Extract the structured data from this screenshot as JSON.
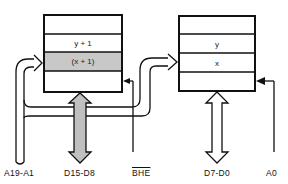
{
  "diagram": {
    "type": "memory-bank-organization",
    "colors": {
      "line": "#111111",
      "highlight_cell": "#c8c8c8",
      "bus_arrow_fill": "#c0c0c0",
      "background": "#ffffff"
    },
    "banks": [
      {
        "id": "high-bank",
        "cells": [
          "",
          "y + 1",
          "(x + 1)",
          ""
        ],
        "highlighted_index": 2
      },
      {
        "id": "low-bank",
        "cells": [
          "",
          "y",
          "x",
          ""
        ],
        "highlighted_index": null
      }
    ],
    "signals": {
      "address": "A19-A1",
      "data_high": "D15-D8",
      "bhe": "BHE",
      "data_low": "D7-D0",
      "a0": "A0"
    }
  }
}
